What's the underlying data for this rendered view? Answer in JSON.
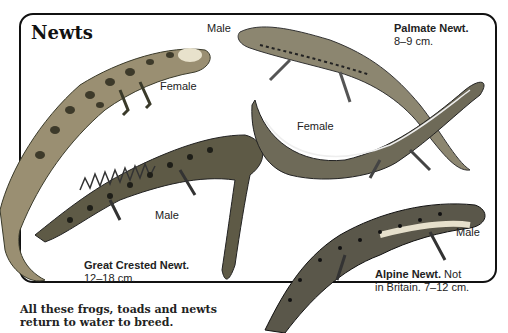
{
  "title": "Newts",
  "labels": {
    "great_crested_female": "Female",
    "great_crested_male": "Male",
    "palmate_male": "Male",
    "palmate_female": "Female",
    "alpine_male": "Male"
  },
  "species": {
    "palmate": {
      "name": "Palmate Newt.",
      "detail": "8–9 cm."
    },
    "great_crested": {
      "name": "Great Crested Newt.",
      "detail": "12–18 cm."
    },
    "alpine": {
      "name": "Alpine Newt.",
      "detail_inline": "Not",
      "detail": "in Britain. 7–12 cm."
    }
  },
  "caption": {
    "line1": "All these frogs, toads and newts",
    "line2": "return to water to breed."
  }
}
